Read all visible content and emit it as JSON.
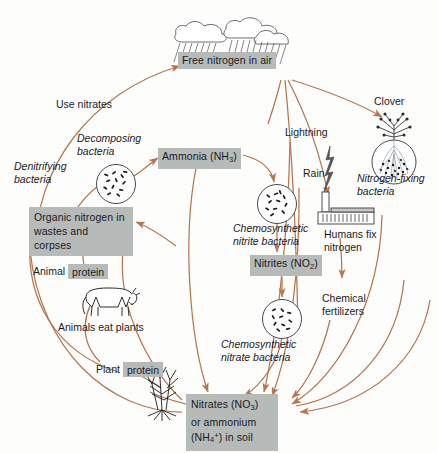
{
  "diagram": {
    "colors": {
      "arrow": "#b5764f",
      "box_fill": "#b6bbba",
      "text": "#1b1b1e",
      "ink": "#3a3a3c"
    }
  },
  "nodes": {
    "free_nitrogen": {
      "label": "Free nitrogen in air",
      "style": "boxed"
    },
    "ammonia": {
      "label": "Ammonia (NH3)",
      "label_html": "Ammonia (NH₃)",
      "style": "boxed"
    },
    "nitrites": {
      "label": "Nitrites (NO2)",
      "label_html": "Nitrites (NO₂)",
      "style": "boxed"
    },
    "organic_nitrogen": {
      "line1": "Organic nitrogen in",
      "line2": "wastes and corpses",
      "style": "boxed"
    },
    "soil": {
      "line1": "Nitrates (NO3)",
      "line2": "or ammonium",
      "line3": "(NH4+) in soil",
      "style": "boxed"
    },
    "animal_protein": {
      "prefix": "Animal",
      "chip": "protein"
    },
    "plant_protein": {
      "prefix": "Plant",
      "chip": "protein"
    }
  },
  "labels": {
    "use_nitrates": "Use nitrates",
    "denitrifying_bacteria": {
      "line1": "Denitrifying",
      "line2": "bacteria"
    },
    "decomposing_bacteria": {
      "line1": "Decomposing",
      "line2": "bacteria"
    },
    "chemosynthetic_nitrite_bacteria": {
      "line1": "Chemosynthetic",
      "line2": "nitrite bacteria"
    },
    "chemosynthetic_nitrate_bacteria": {
      "line1": "Chemosynthetic",
      "line2": "nitrate bacteria"
    },
    "lightning": "Lightning",
    "rain": "Rain",
    "clover": "Clover",
    "nitrogen_fixing_bacteria": {
      "line1": "Nitrogen-fixing",
      "line2": "bacteria"
    },
    "humans_fix_nitrogen": {
      "line1": "Humans fix",
      "line2": "nitrogen"
    },
    "chemical_fertilizers": {
      "line1": "Chemical",
      "line2": "fertilizers"
    },
    "animals_eat_plants": "Animals eat plants"
  },
  "illustrations": {
    "clouds": "rain-clouds-icon",
    "decomposer_circle": "bacteria-colony-icon",
    "nitrite_circle": "bacteria-colony-icon",
    "nitrate_circle": "bacteria-colony-icon",
    "clover_plant": "clover-plant-icon",
    "root_nodules": "root-nodule-circle-icon",
    "factory": "factory-icon",
    "lightning_bolt": "lightning-bolt-icon",
    "cow": "grazing-cow-icon",
    "corn": "corn-plant-icon"
  }
}
